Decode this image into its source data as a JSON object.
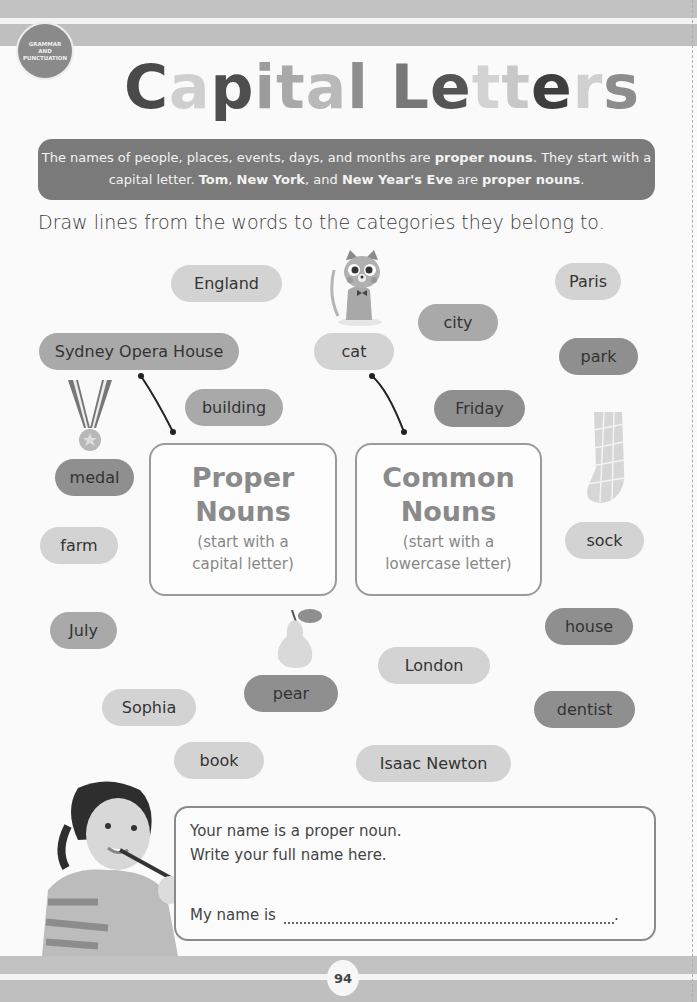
{
  "section_badge": {
    "line1": "GRAMMAR",
    "line2": "AND",
    "line3": "PUNCTUATION"
  },
  "title": {
    "text": "Capital Letters",
    "letters": [
      {
        "ch": "C",
        "color": "#4a4a4a"
      },
      {
        "ch": "a",
        "color": "#cfcfcf"
      },
      {
        "ch": "p",
        "color": "#4e4e4e"
      },
      {
        "ch": "i",
        "color": "#9c9c9c"
      },
      {
        "ch": "t",
        "color": "#a9a9a9"
      },
      {
        "ch": "a",
        "color": "#b9b9b9"
      },
      {
        "ch": "l",
        "color": "#8f8f8f"
      },
      {
        "ch": " ",
        "color": "#000000"
      },
      {
        "ch": "L",
        "color": "#777777"
      },
      {
        "ch": "e",
        "color": "#555555"
      },
      {
        "ch": "t",
        "color": "#d3d3d3"
      },
      {
        "ch": "t",
        "color": "#c8c8c8"
      },
      {
        "ch": "e",
        "color": "#3e3e3e"
      },
      {
        "ch": "r",
        "color": "#d0d0d0"
      },
      {
        "ch": "s",
        "color": "#8d8d8d"
      }
    ]
  },
  "info": {
    "p1": "The names of people, places, events, days, and months are ",
    "b1": "proper nouns",
    "p2": ". They start with a capital letter. ",
    "b2": "Tom",
    "p3": ", ",
    "b3": "New York",
    "p4": ", and ",
    "b4": "New Year's Eve",
    "p5": " are ",
    "b5": "proper nouns",
    "p6": "."
  },
  "instruction": "Draw lines from the words to the categories they belong to.",
  "words": {
    "england": "England",
    "sydney": "Sydney Opera House",
    "cat": "cat",
    "city": "city",
    "paris": "Paris",
    "park": "park",
    "building": "building",
    "friday": "Friday",
    "medal": "medal",
    "farm": "farm",
    "sock": "sock",
    "july": "July",
    "house": "house",
    "london": "London",
    "pear": "pear",
    "sophia": "Sophia",
    "dentist": "dentist",
    "book": "book",
    "newton": "Isaac Newton"
  },
  "categories": {
    "proper": {
      "head1": "Proper",
      "head2": "Nouns",
      "sub1": "(start with a",
      "sub2": "capital letter)"
    },
    "common": {
      "head1": "Common",
      "head2": "Nouns",
      "sub1": "(start with a",
      "sub2": "lowercase letter)"
    }
  },
  "name_box": {
    "line1": "Your name is a proper noun.",
    "line2": "Write your full name here.",
    "prompt": "My name is",
    "input_value": "",
    "end": "."
  },
  "page_number": "94"
}
